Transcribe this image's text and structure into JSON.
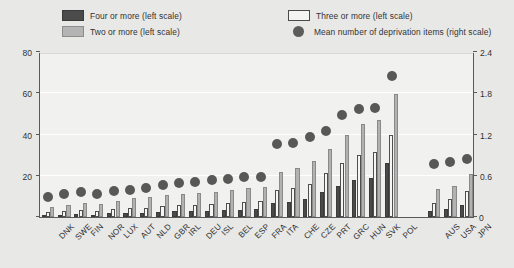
{
  "legend": {
    "items": [
      {
        "label": "Four or more (left scale)",
        "marker": "dark-square-swatch",
        "color": "#4b4b4b"
      },
      {
        "label": "Three or more (left scale)",
        "marker": "white-square-swatch",
        "color": "#f4f4f2"
      },
      {
        "label": "Two or more (left scale)",
        "marker": "gray-square-swatch",
        "color": "#b4b4b4"
      },
      {
        "label": "Mean number of deprivation items (right scale)",
        "marker": "gray-circle-marker",
        "color": "#5c5c5c"
      }
    ]
  },
  "axes": {
    "left_ticks": [
      "0",
      "20",
      "40",
      "60",
      "80"
    ],
    "right_ticks": [
      "0",
      "0.6",
      "1.2",
      "1.8",
      "2.4"
    ],
    "left_range": [
      0,
      80
    ],
    "right_range": [
      0,
      2.4
    ],
    "zero_right_label": "0"
  },
  "chart_data": {
    "type": "bar",
    "title": "",
    "subtitle": "",
    "xlabel": "",
    "ylabel": "",
    "ylim": [
      0,
      80
    ],
    "y2lim": [
      0,
      2.4
    ],
    "grid": true,
    "legend_position": "top",
    "categories": [
      "DNK",
      "SWE",
      "FIN",
      "NOR",
      "LUX",
      "AUT",
      "NLD",
      "GBR",
      "IRL",
      "DEU",
      "ISL",
      "BEL",
      "ESP",
      "FRA",
      "ITA",
      "CHE",
      "CZE",
      "PRT",
      "GRC",
      "HUN",
      "SVK",
      "POL",
      "AUS",
      "USA",
      "JPN"
    ],
    "group_break_after": "POL",
    "series": [
      {
        "name": "Two or more (left scale)",
        "axis": "left",
        "color": "#b2b2b2",
        "values": [
          5.0,
          6.0,
          7.0,
          6.5,
          8.0,
          9.0,
          9.5,
          10.5,
          11.0,
          11.5,
          12.0,
          13.0,
          14.0,
          14.5,
          22.0,
          24.0,
          27.0,
          33.0,
          40.0,
          45.0,
          47.0,
          59.5,
          13.5,
          15.0,
          21.0
        ]
      },
      {
        "name": "Three or more (left scale)",
        "axis": "left",
        "color": "#f6f6f4",
        "values": [
          2.5,
          3.0,
          3.5,
          3.0,
          4.0,
          4.5,
          4.5,
          5.5,
          6.0,
          6.0,
          6.5,
          7.0,
          7.5,
          8.0,
          13.0,
          14.0,
          16.0,
          21.5,
          26.0,
          30.0,
          31.5,
          40.0,
          7.0,
          8.5,
          12.5
        ]
      },
      {
        "name": "Four or more (left scale)",
        "axis": "left",
        "color": "#4a4a4a",
        "values": [
          1.0,
          1.2,
          1.5,
          1.2,
          1.8,
          2.0,
          2.0,
          2.5,
          2.8,
          2.8,
          3.0,
          3.2,
          3.5,
          3.8,
          7.0,
          7.5,
          8.5,
          12.0,
          15.0,
          18.0,
          19.0,
          26.0,
          3.0,
          4.0,
          6.0
        ]
      },
      {
        "name": "Mean number of deprivation items (right scale)",
        "axis": "right",
        "type": "scatter",
        "color": "#585858",
        "values": [
          0.37,
          0.41,
          0.43,
          0.41,
          0.45,
          0.47,
          0.5,
          0.54,
          0.57,
          0.58,
          0.61,
          0.63,
          0.65,
          0.66,
          1.14,
          1.15,
          1.24,
          1.32,
          1.56,
          1.65,
          1.66,
          2.12,
          0.84,
          0.87,
          0.92
        ]
      }
    ]
  }
}
